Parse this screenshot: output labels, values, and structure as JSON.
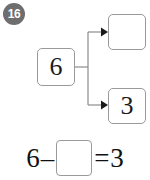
{
  "question": {
    "number": "16",
    "badge_color": "#6e6e6e",
    "badge_text_color": "#ffffff"
  },
  "diagram": {
    "type": "number-bond",
    "whole": {
      "label": "whole-box",
      "value": "6"
    },
    "parts": [
      {
        "label": "part-box-top",
        "value": ""
      },
      {
        "label": "part-box-bottom",
        "value": "3"
      }
    ],
    "connector_color": "#8c8c8c",
    "box_border_color": "#9a9a9a"
  },
  "equation": {
    "minuend": "6",
    "operator": "–",
    "blank": "",
    "equals": "=",
    "result": "3",
    "text": "6 – [ ] = 3"
  }
}
